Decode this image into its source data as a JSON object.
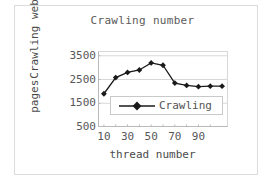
{
  "chart_data": {
    "type": "line",
    "title": "Crawling number",
    "xlabel": "thread number",
    "ylabel_lines": [
      "Crawling web",
      "pages"
    ],
    "ylabel": "Crawling web pages",
    "x": [
      10,
      20,
      30,
      40,
      50,
      60,
      70,
      80,
      90,
      100,
      110
    ],
    "values": [
      1900,
      2580,
      2800,
      2900,
      3200,
      3100,
      2350,
      2250,
      2200,
      2220,
      2220
    ],
    "series": [
      {
        "name": "Crawling",
        "values": [
          1900,
          2580,
          2800,
          2900,
          3200,
          3100,
          2350,
          2250,
          2200,
          2220,
          2220
        ]
      }
    ],
    "xticks": [
      10,
      30,
      50,
      70,
      90
    ],
    "xtick_labels": [
      "10",
      "30",
      "50",
      "70",
      "90"
    ],
    "xminor": [
      20,
      40,
      60,
      80,
      100
    ],
    "yticks": [
      500,
      1500,
      2500,
      3500
    ],
    "ytick_labels": [
      "3500",
      "2500",
      "1500",
      "500"
    ],
    "xlim": [
      5,
      115
    ],
    "ylim": [
      500,
      3700
    ],
    "grid": "horizontal",
    "legend_position": "inside-bottom-center",
    "legend": [
      "Crawling"
    ],
    "marker": "diamond",
    "line_color": "#1a1a1a",
    "marker_color": "#1a1a1a",
    "grid_color": "#d8d8d8",
    "axis_color": "#b9b9b9",
    "background": "#ffffff"
  },
  "legend": {
    "entry_label": "Crawling"
  }
}
